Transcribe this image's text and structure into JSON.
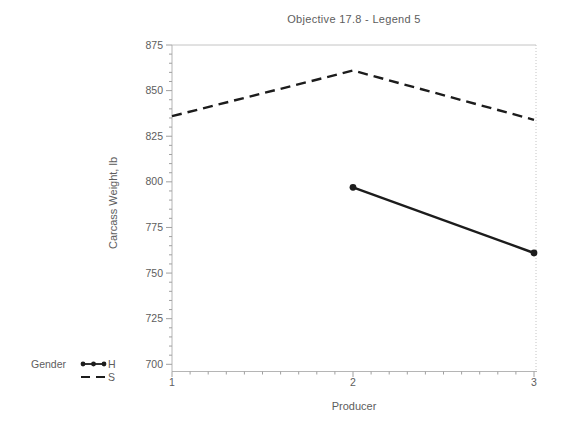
{
  "chart_data": {
    "type": "line",
    "title": "Objective 17.8 - Legend 5",
    "xlabel": "Producer",
    "ylabel": "Carcass Weight, lb",
    "x": [
      1,
      2,
      3
    ],
    "series": [
      {
        "name": "H",
        "style": "solid",
        "marker": "dot",
        "values": [
          null,
          797,
          761
        ]
      },
      {
        "name": "S",
        "style": "dashed",
        "marker": "none",
        "values": [
          836,
          861,
          834
        ]
      }
    ],
    "legend_title": "Gender",
    "legend_position": "bottom-left",
    "xlim": [
      1,
      3
    ],
    "ylim": [
      700,
      875
    ],
    "yticks": [
      700,
      725,
      750,
      775,
      800,
      825,
      850,
      875
    ],
    "xticks": [
      1,
      2,
      3
    ],
    "y_minor_step": 5,
    "x_minor_step": 0.1,
    "grid": false,
    "colors": {
      "line": "#1c1c1c",
      "axis": "#b5b5b5",
      "tick": "#a0a0a0",
      "text": "#5d5d5d",
      "frame": "#c4c4c4"
    }
  }
}
